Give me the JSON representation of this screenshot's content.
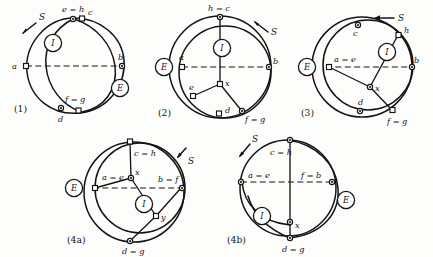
{
  "figure": {
    "ink_color": "#141414",
    "background_color": "#fdfdfb",
    "curve_label": "S",
    "interior_label": "I",
    "exterior_label": "E"
  },
  "panels": [
    {
      "id": "panel-1",
      "number": "(1)",
      "curve_label": "S",
      "interior_label": "I",
      "exterior_label": "E",
      "labels": {
        "top": "e = h",
        "top_right": "c",
        "left": "a",
        "right": "b",
        "lower": "f = g",
        "bottom": "d"
      }
    },
    {
      "id": "panel-2",
      "number": "(2)",
      "curve_label": "S",
      "interior_label": "I",
      "exterior_label": "E",
      "labels": {
        "top": "h = c",
        "left": "a",
        "right": "b",
        "center": "x",
        "lower_left": "e",
        "bottom": "d",
        "lower_right": "f = g"
      }
    },
    {
      "id": "panel-3",
      "number": "(3)",
      "curve_label": "S",
      "interior_label": "I",
      "exterior_label": "E",
      "labels": {
        "upper_left": "c",
        "upper_right": "h",
        "left": "a = e",
        "right": "b",
        "center": "x",
        "bottom": "d",
        "lower_right": "f = g"
      }
    },
    {
      "id": "panel-4a",
      "number": "(4a)",
      "curve_label": "S",
      "interior_label": "I",
      "exterior_label": "E",
      "labels": {
        "top": "c = h",
        "left": "a = e",
        "center": "x",
        "right": "b = f",
        "lower_right": "y",
        "bottom": "d = g"
      }
    },
    {
      "id": "panel-4b",
      "number": "(4b)",
      "curve_label": "S",
      "interior_label": "I",
      "exterior_label": "E",
      "labels": {
        "top": "c = h",
        "left": "a = e",
        "right": "f = b",
        "center": "x",
        "bottom": "d = g"
      }
    }
  ]
}
